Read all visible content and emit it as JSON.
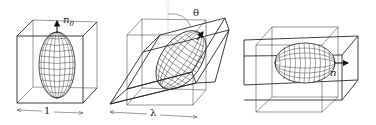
{
  "figure": {
    "panels": [
      {
        "id": "reference",
        "shape": "ellipsoid-in-cube",
        "orientation_label": "n",
        "orientation_subscript": "0",
        "dimension_label": "1",
        "cube": {
          "front": [
            17,
            36,
            83,
            103
          ],
          "back_offset": [
            15,
            -15
          ]
        },
        "ellipsoid": {
          "cx": 57,
          "cy": 65,
          "rx": 18,
          "ry": 33,
          "rotation": 0
        }
      },
      {
        "id": "sheared",
        "shape": "ellipsoid-in-sheared-cube",
        "angle_label": "θ",
        "dimension_label": "λ",
        "ellipsoid": {
          "cx": 181,
          "cy": 60,
          "rx": 20,
          "ry": 33,
          "rotation": 35
        }
      },
      {
        "id": "rotated",
        "shape": "ellipsoid-in-rotated-cube",
        "orientation_label": "n",
        "ellipsoid": {
          "cx": 305,
          "cy": 63,
          "rx": 30,
          "ry": 20,
          "rotation": 0
        }
      }
    ],
    "colors": {
      "line": "#2a2a2a",
      "background": "#ffffff"
    }
  }
}
